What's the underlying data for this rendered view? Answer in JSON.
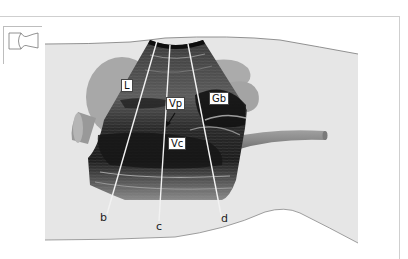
{
  "figure": {
    "type": "ultrasound-scan-diagram",
    "orientation_thumbnail_icon": "body-orientation-icon",
    "structure_labels": [
      {
        "id": "L",
        "text": "L"
      },
      {
        "id": "Vp",
        "text": "Vp"
      },
      {
        "id": "Gb",
        "text": "Gb"
      },
      {
        "id": "Vc",
        "text": "Vc"
      }
    ],
    "scan_line_labels": [
      {
        "id": "b",
        "text": "b"
      },
      {
        "id": "c",
        "text": "c"
      },
      {
        "id": "d",
        "text": "d"
      }
    ]
  },
  "colors": {
    "body_fill": "#e6e6e6",
    "body_outline": "#777777",
    "organ_fill": "#a8a8a8",
    "vessel_fill": "#8f8f8f",
    "scan_dark": "#1e1e1e",
    "scan_mid": "#5a5a5a",
    "scan_line": "#f2f2f2",
    "frame": "#cfcfcf"
  }
}
